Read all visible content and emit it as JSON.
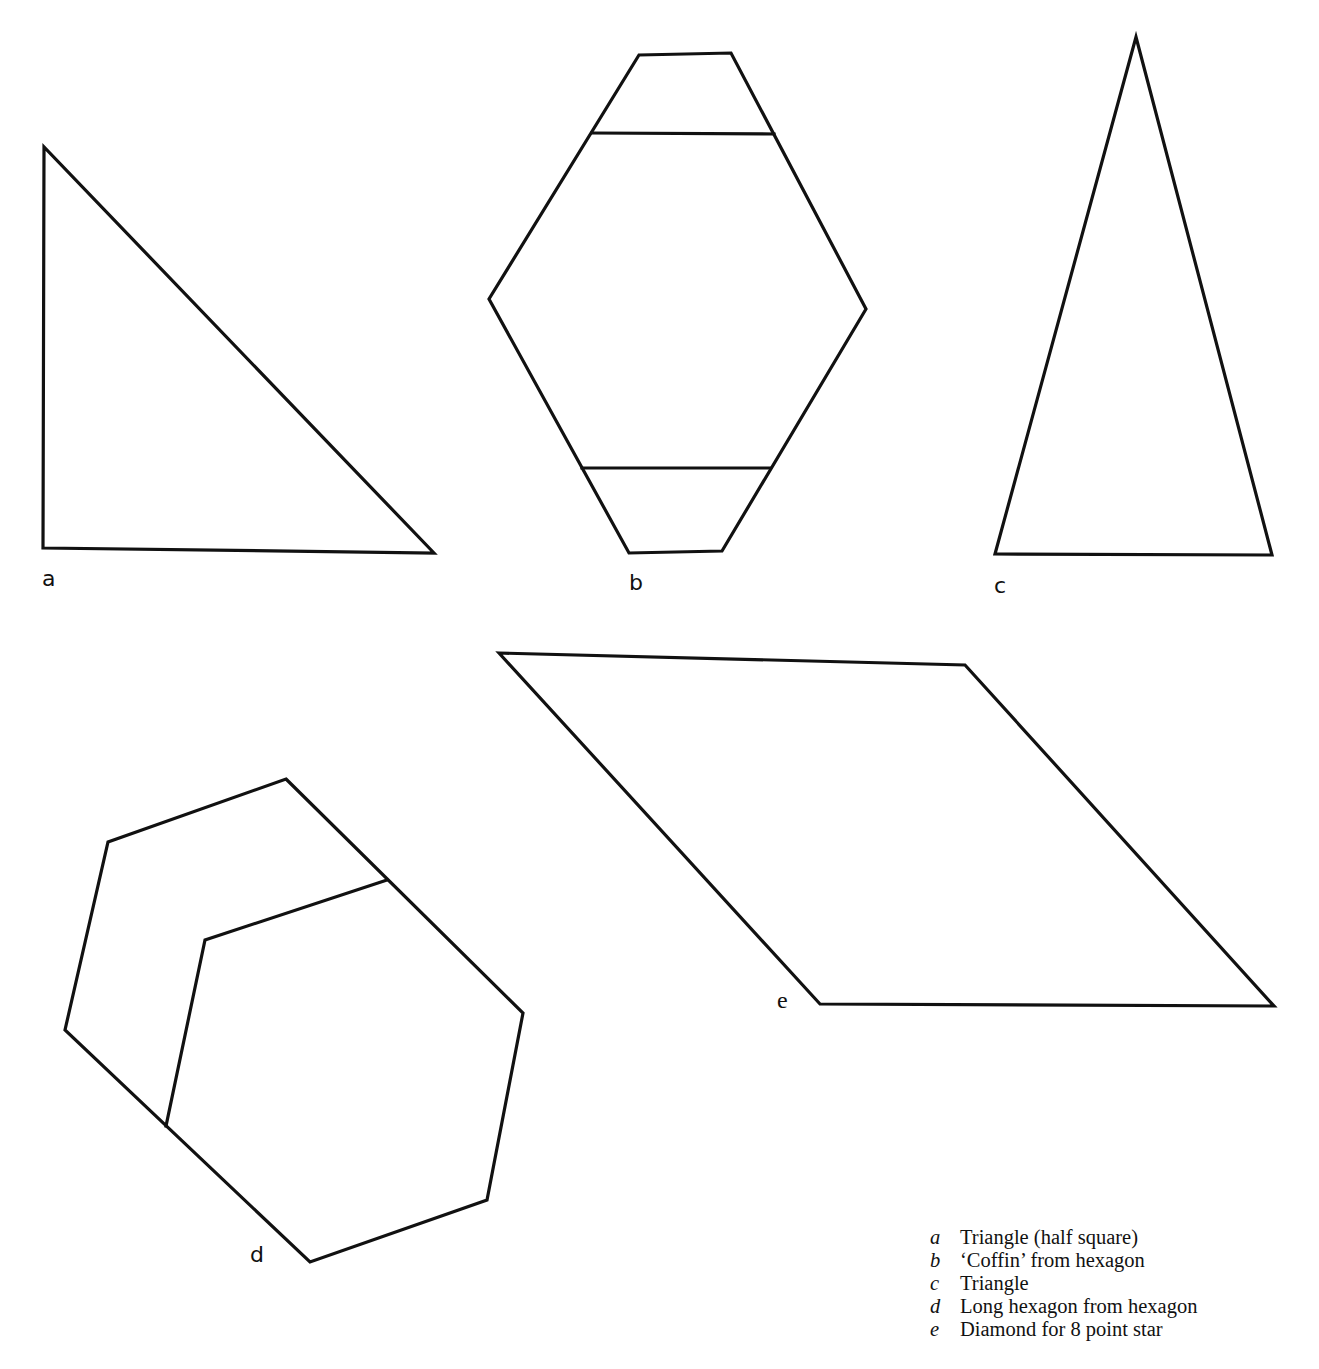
{
  "diagram": {
    "stroke_color": "#111111",
    "background": "#ffffff",
    "shapes": {
      "a": {
        "label": "a",
        "label_pos": [
          42,
          568
        ],
        "outline": [
          [
            44,
            147
          ],
          [
            43,
            548
          ],
          [
            434,
            553
          ]
        ]
      },
      "b": {
        "label": "b",
        "label_pos": [
          629,
          572
        ],
        "outline": [
          [
            639,
            55
          ],
          [
            731,
            53
          ],
          [
            866,
            309
          ],
          [
            722,
            551
          ],
          [
            629,
            553
          ],
          [
            489,
            299
          ]
        ],
        "cut_lines": [
          [
            [
              592,
              133
            ],
            [
              774,
              134
            ]
          ],
          [
            [
              582,
              468
            ],
            [
              770,
              468
            ]
          ]
        ]
      },
      "c": {
        "label": "c",
        "label_pos": [
          994,
          575
        ],
        "outline": [
          [
            1136,
            37
          ],
          [
            1272,
            555
          ],
          [
            995,
            554
          ]
        ]
      },
      "d": {
        "label": "d",
        "label_pos": [
          250,
          1244
        ],
        "outline": [
          [
            286,
            779
          ],
          [
            523,
            1013
          ],
          [
            487,
            1200
          ],
          [
            310,
            1262
          ],
          [
            65,
            1030
          ],
          [
            108,
            842
          ]
        ],
        "inner_lines": [
          [
            [
              387,
              880
            ],
            [
              205,
              940
            ],
            [
              166,
              1126
            ]
          ]
        ]
      },
      "e": {
        "label": "e",
        "label_pos": [
          777,
          988
        ],
        "outline": [
          [
            499,
            653
          ],
          [
            965,
            665
          ],
          [
            1274,
            1006
          ],
          [
            820,
            1004
          ]
        ]
      }
    }
  },
  "legend": {
    "items": [
      {
        "key": "a",
        "text": "Triangle (half square)"
      },
      {
        "key": "b",
        "text": "‘Coffin’ from hexagon"
      },
      {
        "key": "c",
        "text": "Triangle"
      },
      {
        "key": "d",
        "text": "Long hexagon from hexagon"
      },
      {
        "key": "e",
        "text": "Diamond for 8 point star"
      }
    ]
  }
}
